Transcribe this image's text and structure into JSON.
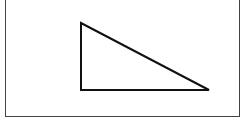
{
  "diagram": {
    "type": "right-triangle",
    "stroke_color": "#111111",
    "frame_color": "#444444",
    "vertices": {
      "top": [
        81,
        23
      ],
      "bottom_left": [
        81,
        90
      ],
      "bottom_right": [
        209,
        90
      ]
    }
  }
}
